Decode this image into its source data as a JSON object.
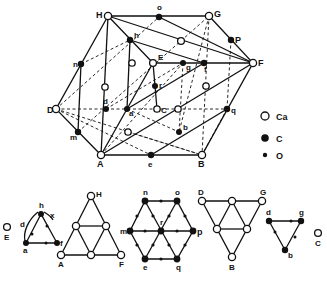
{
  "figure": {
    "legend": [
      {
        "symbol": "open-circle",
        "label": "Ca"
      },
      {
        "symbol": "filled-circle-large",
        "label": "C"
      },
      {
        "symbol": "filled-circle-small",
        "label": "O"
      }
    ],
    "main_labels": {
      "H": "H",
      "o": "o",
      "G": "G",
      "P": "P",
      "F": "F",
      "h": "h",
      "E": "E",
      "g": "g",
      "f": "f",
      "n": "n",
      "r": "r",
      "D": "D",
      "d": "d",
      "a": "a",
      "C": "C",
      "q": "q",
      "m": "m",
      "b": "b",
      "A": "A",
      "e": "e",
      "B": "B"
    },
    "sub_diagrams": [
      {
        "name": "triangle-ahf",
        "side_label": "E",
        "labels": {
          "h": "h",
          "d": "d",
          "x": "x",
          "a": "a",
          "f": "f"
        }
      },
      {
        "name": "triangle-HAF",
        "labels": {
          "H": "H",
          "A": "A",
          "F": "F"
        }
      },
      {
        "name": "hexagon-nopqem",
        "labels": {
          "n": "n",
          "o": "o",
          "m": "m",
          "r": "r",
          "p": "p",
          "e": "e",
          "q": "q"
        }
      },
      {
        "name": "triangle-DGB",
        "labels": {
          "D": "D",
          "G": "G",
          "B": "B"
        }
      },
      {
        "name": "triangle-dgb",
        "side_label": "C",
        "labels": {
          "d": "d",
          "g": "g",
          "b": "b"
        }
      }
    ]
  }
}
